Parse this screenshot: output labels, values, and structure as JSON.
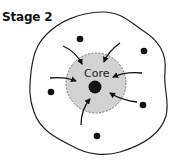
{
  "diagram": {
    "title": "Stage 2",
    "core_label": "Core",
    "colors": {
      "outline": "#222222",
      "core_fill": "#d2d2d2",
      "core_border": "#777777",
      "particle": "#111111",
      "arrow": "#111111"
    },
    "particles": [
      {
        "x": 80,
        "y": 39
      },
      {
        "x": 144,
        "y": 51
      },
      {
        "x": 51,
        "y": 92
      },
      {
        "x": 143,
        "y": 105
      },
      {
        "x": 97,
        "y": 136
      }
    ],
    "arrows": [
      {
        "from": "upper-left",
        "to": "core"
      },
      {
        "from": "upper-right",
        "to": "core"
      },
      {
        "from": "left",
        "to": "core"
      },
      {
        "from": "right",
        "to": "core"
      },
      {
        "from": "lower-right",
        "to": "core"
      },
      {
        "from": "bottom",
        "to": "core"
      }
    ]
  }
}
